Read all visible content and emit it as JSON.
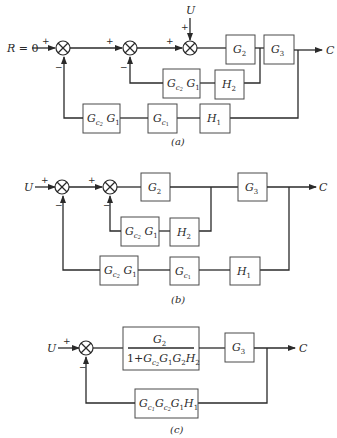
{
  "panels": {
    "a": {
      "caption": "(a)",
      "input_label": "R = 0",
      "disturbance_label": "U",
      "output_label": "C",
      "blocks": {
        "g2": "G2",
        "g3": "G3",
        "inner_feedback_gain": "Gc2 G1",
        "h2": "H2",
        "outer_gc2g1": "Gc2 G1",
        "outer_gc1": "Gc1",
        "h1": "H1"
      },
      "signs": {
        "j1_in": "+",
        "j1_fb": "−",
        "j2_in": "+",
        "j2_fb": "−",
        "j3_in": "+",
        "j3_u": "+"
      }
    },
    "b": {
      "caption": "(b)",
      "input_label": "U",
      "output_label": "C",
      "blocks": {
        "g2": "G2",
        "g3": "G3",
        "inner_feedback_gain": "Gc2 G1",
        "h2": "H2",
        "outer_gc2g1": "Gc2 G1",
        "outer_gc1": "Gc1",
        "h1": "H1"
      },
      "signs": {
        "j1_in": "+",
        "j1_fb": "−",
        "j2_in": "+",
        "j2_fb": "−"
      }
    },
    "c": {
      "caption": "(c)",
      "input_label": "U",
      "output_label": "C",
      "blocks": {
        "forward_numerator": "G2",
        "forward_denominator": "1+Gc2 G1 G2 H2",
        "g3": "G3",
        "feedback": "Gc1 Gc2 G1 H1"
      },
      "signs": {
        "j1_in": "+",
        "j1_fb": "−"
      }
    }
  }
}
